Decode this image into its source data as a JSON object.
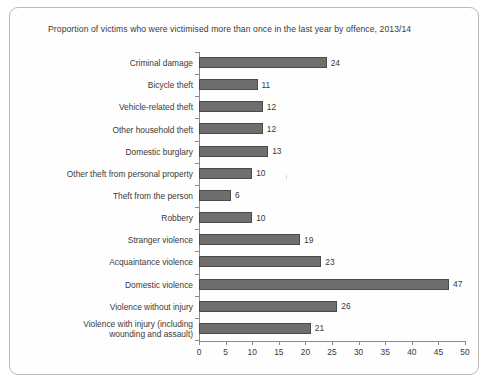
{
  "chart_data": {
    "type": "bar",
    "orientation": "horizontal",
    "title": "Proportion of victims who were victimised more than once in the last year by offence, 2013/14",
    "xlabel": "",
    "ylabel": "",
    "xlim": [
      0,
      50
    ],
    "xticks": [
      0,
      5,
      10,
      15,
      20,
      25,
      30,
      35,
      40,
      45,
      50
    ],
    "grid": false,
    "legend": false,
    "bar_color": "#6e6e6e",
    "bar_border_color": "#4a4a4a",
    "categories": [
      "Criminal damage",
      "Bicycle theft",
      "Vehicle-related theft",
      "Other household theft",
      "Domestic burglary",
      "Other theft from personal property",
      "Theft from the person",
      "Robbery",
      "Stranger violence",
      "Acquaintance violence",
      "Domestic violence",
      "Violence without injury",
      "Violence with injury (including\nwounding and assault)"
    ],
    "values": [
      24,
      11,
      12,
      12,
      13,
      10,
      6,
      10,
      19,
      23,
      47,
      26,
      21
    ],
    "data_labels": [
      "24",
      "11",
      "12",
      "12",
      "13",
      "10",
      "6",
      "10",
      "19",
      "23",
      "47",
      "26",
      "21"
    ],
    "tick_labels": [
      "0",
      "5",
      "10",
      "15",
      "20",
      "25",
      "30",
      "35",
      "40",
      "45",
      "50"
    ]
  }
}
